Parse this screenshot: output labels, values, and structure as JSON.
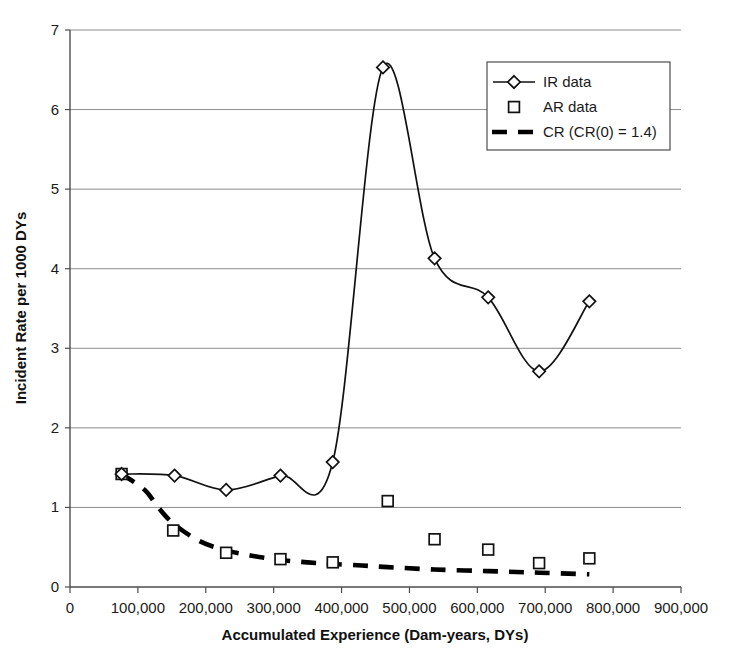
{
  "chart_data": {
    "type": "line",
    "title": "",
    "xlabel": "Accumulated Experience (Dam-years, DYs)",
    "ylabel": "Incident Rate per 1000 DYs",
    "xlim": [
      0,
      900000
    ],
    "ylim": [
      0,
      7
    ],
    "xticks": [
      0,
      100000,
      200000,
      300000,
      400000,
      500000,
      600000,
      700000,
      800000,
      900000
    ],
    "xtick_labels": [
      "0",
      "100,000",
      "200,000",
      "300,000",
      "400,000",
      "500,000",
      "600,000",
      "700,000",
      "800,000",
      "900,000"
    ],
    "yticks": [
      0,
      1,
      2,
      3,
      4,
      5,
      6,
      7
    ],
    "ytick_labels": [
      "0",
      "1",
      "2",
      "3",
      "4",
      "5",
      "6",
      "7"
    ],
    "grid": "horizontal",
    "legend_position": "top-right",
    "series": [
      {
        "name": "IR data",
        "marker": "diamond",
        "style": "line-with-markers",
        "points": [
          {
            "x": 76000,
            "y": 1.42
          },
          {
            "x": 154000,
            "y": 1.4
          },
          {
            "x": 230000,
            "y": 1.22
          },
          {
            "x": 310000,
            "y": 1.4
          },
          {
            "x": 387000,
            "y": 1.57
          },
          {
            "x": 461000,
            "y": 6.53
          },
          {
            "x": 537000,
            "y": 4.13
          },
          {
            "x": 616000,
            "y": 3.64
          },
          {
            "x": 691000,
            "y": 2.71
          },
          {
            "x": 765000,
            "y": 3.59
          }
        ]
      },
      {
        "name": "AR data",
        "marker": "square",
        "style": "markers-only",
        "points": [
          {
            "x": 76000,
            "y": 1.42
          },
          {
            "x": 152000,
            "y": 0.71
          },
          {
            "x": 230000,
            "y": 0.43
          },
          {
            "x": 310000,
            "y": 0.35
          },
          {
            "x": 387000,
            "y": 0.31
          },
          {
            "x": 468000,
            "y": 1.08
          },
          {
            "x": 537000,
            "y": 0.6
          },
          {
            "x": 616000,
            "y": 0.47
          },
          {
            "x": 691000,
            "y": 0.3
          },
          {
            "x": 765000,
            "y": 0.36
          }
        ]
      },
      {
        "name": "CR (CR(0) = 1.4)",
        "marker": "none",
        "style": "dashed-line",
        "points": [
          {
            "x": 76000,
            "y": 1.42
          },
          {
            "x": 110000,
            "y": 1.22
          },
          {
            "x": 130000,
            "y": 1.0
          },
          {
            "x": 152000,
            "y": 0.8
          },
          {
            "x": 190000,
            "y": 0.58
          },
          {
            "x": 230000,
            "y": 0.46
          },
          {
            "x": 270000,
            "y": 0.39
          },
          {
            "x": 310000,
            "y": 0.34
          },
          {
            "x": 350000,
            "y": 0.31
          },
          {
            "x": 387000,
            "y": 0.29
          },
          {
            "x": 430000,
            "y": 0.27
          },
          {
            "x": 468000,
            "y": 0.25
          },
          {
            "x": 537000,
            "y": 0.22
          },
          {
            "x": 616000,
            "y": 0.2
          },
          {
            "x": 691000,
            "y": 0.18
          },
          {
            "x": 765000,
            "y": 0.16
          }
        ]
      }
    ]
  },
  "legend": {
    "entries": [
      {
        "label": "IR data",
        "marker": "diamond-line"
      },
      {
        "label": "AR data",
        "marker": "square"
      },
      {
        "label": "CR (CR(0) = 1.4)",
        "marker": "dashed"
      }
    ]
  },
  "axes": {
    "x_title": "Accumulated Experience (Dam-years, DYs)",
    "y_title": "Incident Rate per 1000 DYs"
  }
}
